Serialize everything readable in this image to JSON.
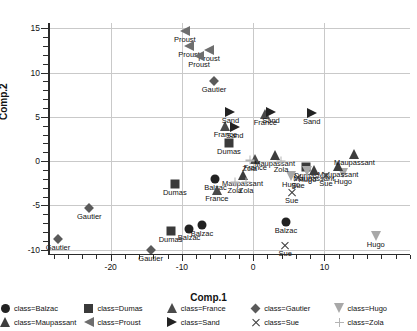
{
  "chart_data": {
    "type": "scatter",
    "title": "",
    "xlabel": "Comp.1",
    "ylabel": "Comp.2",
    "xlim": [
      -28.8,
      22.0
    ],
    "ylim": [
      -10.6,
      15.6
    ],
    "xticks": [
      -20,
      -10,
      0,
      10
    ],
    "yticks": [
      15,
      10,
      5,
      0,
      -5,
      -10
    ],
    "grid": true,
    "legend_position": "bottom",
    "legend_title_prefix": "class=",
    "series": [
      {
        "name": "Balzac",
        "legend_label": "class=Balzac",
        "marker": "circle",
        "color": "#222222",
        "points": [
          {
            "x": -5.3,
            "y": -2.0,
            "label": "Balzac"
          },
          {
            "x": -9.0,
            "y": -7.7,
            "label": "Balzac"
          },
          {
            "x": -7.2,
            "y": -7.2,
            "label": "Balzac"
          },
          {
            "x": 4.6,
            "y": -6.9,
            "label": "Balzac"
          }
        ]
      },
      {
        "name": "Dumas",
        "legend_label": "class=Dumas",
        "marker": "square",
        "color": "#3a3a3a",
        "points": [
          {
            "x": -3.4,
            "y": 2.1,
            "label": "Dumas"
          },
          {
            "x": -11.0,
            "y": -2.6,
            "label": "Dumas"
          },
          {
            "x": -11.6,
            "y": -7.9,
            "label": "Dumas"
          },
          {
            "x": 7.4,
            "y": -0.7,
            "label": "Dumas"
          }
        ]
      },
      {
        "name": "France",
        "legend_label": "class=France",
        "marker": "triangle-up",
        "color": "#4a4a4a",
        "points": [
          {
            "x": -3.9,
            "y": 4.0,
            "label": "France"
          },
          {
            "x": 1.7,
            "y": 5.3,
            "label": "France"
          },
          {
            "x": -5.1,
            "y": -3.3,
            "label": "France"
          },
          {
            "x": 0.3,
            "y": 0.2,
            "label": "France"
          }
        ]
      },
      {
        "name": "Gautier",
        "legend_label": "class=Gautier",
        "marker": "diamond",
        "color": "#5a5a5a",
        "points": [
          {
            "x": -5.5,
            "y": 9.1,
            "label": "Gautier"
          },
          {
            "x": -23.0,
            "y": -5.3,
            "label": "Gautier"
          },
          {
            "x": -27.4,
            "y": -8.8,
            "label": "Gautier"
          },
          {
            "x": -14.4,
            "y": -10.0,
            "label": "Gautier"
          }
        ]
      },
      {
        "name": "Hugo",
        "legend_label": "class=Hugo",
        "marker": "triangle-down",
        "color": "#a8a8a8",
        "points": [
          {
            "x": 5.3,
            "y": -1.7,
            "label": "Hugo"
          },
          {
            "x": 7.6,
            "y": -1.1,
            "label": "Hugo"
          },
          {
            "x": 12.6,
            "y": -1.3,
            "label": "Hugo"
          },
          {
            "x": 17.2,
            "y": -8.4,
            "label": "Hugo"
          }
        ]
      },
      {
        "name": "Maupassant",
        "legend_label": "class=Maupassant",
        "marker": "triangle-up",
        "color": "#3d3d3d",
        "points": [
          {
            "x": 3.0,
            "y": 0.7,
            "label": "Maupassant"
          },
          {
            "x": -1.5,
            "y": -1.6,
            "label": "Maupassant"
          },
          {
            "x": 8.5,
            "y": -1.0,
            "label": "Maupassant"
          },
          {
            "x": 11.9,
            "y": -0.5,
            "label": "Maupassant"
          },
          {
            "x": 14.2,
            "y": 0.8,
            "label": "Maupassant"
          }
        ]
      },
      {
        "name": "Proust",
        "legend_label": "class=Proust",
        "marker": "triangle-left",
        "color": "#6e6e6e",
        "points": [
          {
            "x": -9.6,
            "y": 14.7,
            "label": "Proust"
          },
          {
            "x": -9.0,
            "y": 13.0,
            "label": "Proust"
          },
          {
            "x": -6.2,
            "y": 12.6,
            "label": "Proust"
          },
          {
            "x": -7.6,
            "y": 11.9,
            "label": "Proust"
          }
        ]
      },
      {
        "name": "Sand",
        "legend_label": "class=Sand",
        "marker": "triangle-right",
        "color": "#222222",
        "points": [
          {
            "x": -3.2,
            "y": 5.6,
            "label": "Sand"
          },
          {
            "x": -2.6,
            "y": 3.8,
            "label": "Sand"
          },
          {
            "x": 2.5,
            "y": 5.5,
            "label": "Sand"
          },
          {
            "x": 8.2,
            "y": 5.4,
            "label": "Sand"
          }
        ]
      },
      {
        "name": "Sue",
        "legend_label": "class=Sue",
        "marker": "x",
        "color": "#3b3b3b",
        "points": [
          {
            "x": 6.3,
            "y": -1.8,
            "label": "Sue"
          },
          {
            "x": 10.2,
            "y": -1.6,
            "label": "Sue"
          },
          {
            "x": 5.4,
            "y": -3.5,
            "label": "Sue"
          },
          {
            "x": 4.5,
            "y": -9.5,
            "label": "Sue"
          }
        ]
      },
      {
        "name": "Zola",
        "legend_label": "class=Zola",
        "marker": "plus",
        "color": "#b4b4b4",
        "points": [
          {
            "x": -0.5,
            "y": 0.1,
            "label": "Zola"
          },
          {
            "x": 3.9,
            "y": 0.0,
            "label": "Zola"
          },
          {
            "x": -2.6,
            "y": -2.4,
            "label": "Zola"
          },
          {
            "x": -1.0,
            "y": -2.3,
            "label": "Zola"
          }
        ]
      }
    ]
  },
  "legend": {
    "rows": [
      [
        "Balzac",
        "Dumas",
        "France",
        "Gautier",
        "Hugo"
      ],
      [
        "Maupassant",
        "Proust",
        "Sand",
        "Sue",
        "Zola"
      ]
    ]
  }
}
